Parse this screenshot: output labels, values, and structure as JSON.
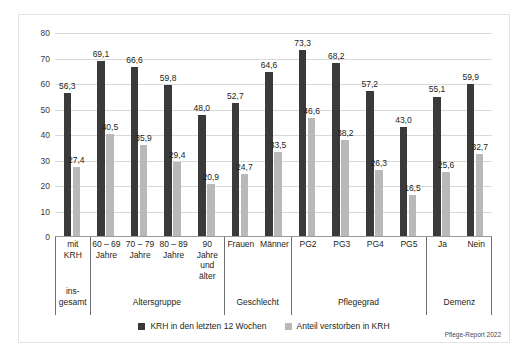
{
  "chart_data": {
    "type": "bar",
    "title": "",
    "xlabel": "",
    "ylabel": "",
    "ylim": [
      0,
      80
    ],
    "ystep": 10,
    "grid": true,
    "legend_position": "bottom-center",
    "yticks": [
      "80",
      "70",
      "60",
      "50",
      "40",
      "30",
      "20",
      "10",
      "0"
    ],
    "categories": [
      "mit\nKRH",
      "60 – 69\nJahre",
      "70 – 79\nJahre",
      "80 – 89\nJahre",
      "90\nJahre\nund\nälter",
      "Frauen",
      "Männer",
      "PG2",
      "PG3",
      "PG4",
      "PG5",
      "Ja",
      "Nein"
    ],
    "groups": [
      {
        "label": "ins-\ngesamt",
        "span": 1
      },
      {
        "label": "Altersgruppe",
        "span": 4
      },
      {
        "label": "Geschlecht",
        "span": 2
      },
      {
        "label": "Pflegegrad",
        "span": 4
      },
      {
        "label": "Demenz",
        "span": 2
      }
    ],
    "series": [
      {
        "name": "KRH in den letzten 12 Wochen",
        "color": "#3a3a3a",
        "values": [
          56.3,
          69.1,
          66.6,
          59.8,
          48.0,
          52.7,
          64.6,
          73.3,
          68.2,
          57.2,
          43.0,
          55.1,
          59.9
        ],
        "labels": [
          "56,3",
          "69,1",
          "66,6",
          "59,8",
          "48,0",
          "52,7",
          "64,6",
          "73,3",
          "68,2",
          "57,2",
          "43,0",
          "55,1",
          "59,9"
        ]
      },
      {
        "name": "Anteil verstorben in KRH",
        "color": "#b9b9b9",
        "values": [
          27.4,
          40.5,
          35.9,
          29.4,
          20.9,
          24.7,
          33.5,
          46.6,
          38.2,
          26.3,
          16.5,
          25.6,
          32.7
        ],
        "labels": [
          "27,4",
          "40,5",
          "35,9",
          "29,4",
          "20,9",
          "24,7",
          "33,5",
          "46,6",
          "38,2",
          "26,3",
          "16,5",
          "25,6",
          "32,7"
        ]
      }
    ]
  },
  "source": "Pflege-Report 2022"
}
